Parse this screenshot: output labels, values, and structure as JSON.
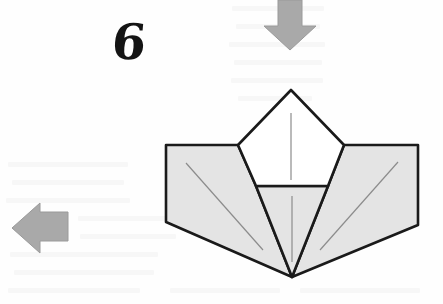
{
  "document": {
    "kind": "origami-instruction-diagram",
    "step_label": "6",
    "background_color": "#fefefe"
  },
  "palette": {
    "paper_fill": "#e4e4e4",
    "paper_white": "#ffffff",
    "outline": "#1a1a1a",
    "crease": "#8c8c8c",
    "arrow_fill": "#a9a9a9",
    "arrow_edge": "#9a9a9a",
    "number_color": "#141414"
  },
  "arrows": [
    {
      "name": "fold-down-arrow",
      "direction": "down",
      "label": "",
      "points": "278,0 302,0 302,26 316,26 290,50 264,26 278,26",
      "fill": "#a9a9a9"
    },
    {
      "name": "fold-left-arrow",
      "direction": "left",
      "label": "",
      "points": "68,212 68,241 40,241 40,253 12,228 40,203 40,212",
      "fill": "#a9a9a9"
    }
  ],
  "model": {
    "name": "folded-paper-model",
    "shapes": [
      {
        "name": "left-wing-panel",
        "fill": "#e4e4e4",
        "points": "166,145 238,145 256,186 292,277 166,222"
      },
      {
        "name": "right-wing-panel",
        "fill": "#e4e4e4",
        "points": "344,145 418,145 418,225 292,277 328,186"
      },
      {
        "name": "center-lower-triangle",
        "fill": "#e4e4e4",
        "points": "256,186 328,186 292,277"
      },
      {
        "name": "top-pentagon-flap",
        "fill": "#ffffff",
        "points": "291,90 344,145 328,186 256,186 238,145"
      }
    ],
    "creases": [
      {
        "name": "crease-pentagon-center",
        "x1": 291,
        "y1": 113,
        "x2": 291,
        "y2": 180
      },
      {
        "name": "crease-lower-center",
        "x1": 292,
        "y1": 196,
        "x2": 292,
        "y2": 262
      },
      {
        "name": "crease-left-wing-diagonal",
        "x1": 186,
        "y1": 163,
        "x2": 263,
        "y2": 250
      },
      {
        "name": "crease-right-wing-diagonal",
        "x1": 398,
        "y1": 162,
        "x2": 320,
        "y2": 250
      }
    ]
  },
  "ghost_marks": [
    {
      "x": 232,
      "y": 6,
      "w": 92
    },
    {
      "x": 236,
      "y": 24,
      "w": 84
    },
    {
      "x": 229,
      "y": 42,
      "w": 96
    },
    {
      "x": 234,
      "y": 60,
      "w": 88
    },
    {
      "x": 231,
      "y": 78,
      "w": 92
    },
    {
      "x": 238,
      "y": 96,
      "w": 74
    },
    {
      "x": 8,
      "y": 162,
      "w": 120
    },
    {
      "x": 12,
      "y": 180,
      "w": 112
    },
    {
      "x": 6,
      "y": 198,
      "w": 124
    },
    {
      "x": 78,
      "y": 216,
      "w": 92
    },
    {
      "x": 80,
      "y": 234,
      "w": 96
    },
    {
      "x": 10,
      "y": 252,
      "w": 148
    },
    {
      "x": 14,
      "y": 270,
      "w": 140
    },
    {
      "x": 8,
      "y": 288,
      "w": 132
    },
    {
      "x": 170,
      "y": 288,
      "w": 110
    },
    {
      "x": 300,
      "y": 288,
      "w": 120
    }
  ]
}
